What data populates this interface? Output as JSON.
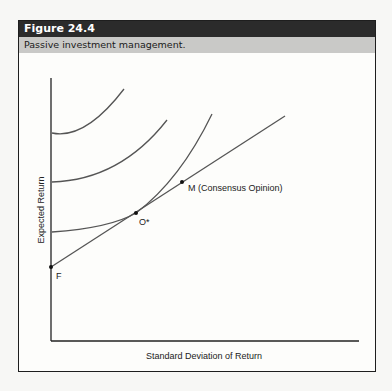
{
  "figure": {
    "number": "Figure 24.4",
    "caption": "Passive investment management."
  },
  "chart_data": {
    "type": "line",
    "title": "Passive investment management.",
    "xlabel": "Standard Deviation of Return",
    "ylabel": "Expected Return",
    "grid": false,
    "legend": "none",
    "axes": {
      "origin": [
        51,
        341
      ],
      "x_end": [
        359,
        341
      ],
      "y_top": [
        51,
        78
      ]
    },
    "indifference_curves": [
      {
        "name": "curve-1",
        "path": "M52,133 Q85,140 124,89"
      },
      {
        "name": "curve-2",
        "path": "M52,182 Q120,180 167,120"
      },
      {
        "name": "curve-3",
        "path": "M52,232 Q110,228 136,213 Q180,180 212,114"
      }
    ],
    "capital_market_line": {
      "from": [
        51,
        267
      ],
      "to": [
        285,
        116
      ]
    },
    "points": [
      {
        "id": "F",
        "label": "F",
        "x": 51,
        "y": 267,
        "label_dx": 5,
        "label_dy": 12
      },
      {
        "id": "O*",
        "label": "O*",
        "x": 136,
        "y": 213,
        "label_dx": 3,
        "label_dy": 12
      },
      {
        "id": "M",
        "label": "M (Consensus Opinion)",
        "x": 182,
        "y": 182,
        "label_dx": 6,
        "label_dy": 9
      }
    ]
  },
  "colors": {
    "title_bar": "#2b2b2b",
    "subtitle_bar": "#c9c9c7",
    "curve": "#555555",
    "axis": "#222222"
  }
}
